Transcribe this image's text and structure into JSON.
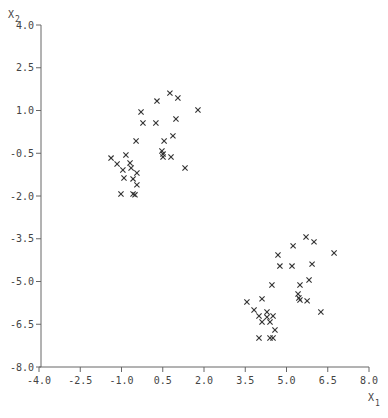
{
  "chart_data": {
    "type": "scatter",
    "title": "",
    "xlabel": "X1",
    "ylabel": "X2",
    "xlabel_main": "X",
    "xlabel_sub": "1",
    "ylabel_main": "X",
    "ylabel_sub": "2",
    "xlim": [
      -4.0,
      8.0
    ],
    "ylim": [
      -8.0,
      4.0
    ],
    "grid": false,
    "legend": null,
    "marker": "x",
    "x_ticks": [
      "-4.0",
      "-2.5",
      "-1.0",
      "0.5",
      "2.0",
      "3.5",
      "5.0",
      "6.5",
      "8.0"
    ],
    "y_ticks": [
      "4.0",
      "2.5",
      "1.0",
      "-0.5",
      "-2.0",
      "-3.5",
      "-5.0",
      "-6.5",
      "-8.0"
    ],
    "series": [
      {
        "name": "cluster-1",
        "points": [
          [
            0.76,
            1.61
          ],
          [
            1.05,
            1.44
          ],
          [
            0.29,
            1.33
          ],
          [
            1.78,
            1.02
          ],
          [
            -0.29,
            0.95
          ],
          [
            -0.22,
            0.56
          ],
          [
            0.25,
            0.56
          ],
          [
            0.98,
            0.7
          ],
          [
            -0.47,
            -0.07
          ],
          [
            0.55,
            -0.07
          ],
          [
            0.87,
            0.11
          ],
          [
            0.47,
            -0.42
          ],
          [
            0.51,
            -0.53
          ],
          [
            0.51,
            -0.63
          ],
          [
            0.8,
            -0.63
          ],
          [
            1.31,
            -1.02
          ],
          [
            -1.38,
            -0.67
          ],
          [
            -0.84,
            -0.56
          ],
          [
            -1.16,
            -0.88
          ],
          [
            -0.69,
            -0.84
          ],
          [
            -0.95,
            -1.09
          ],
          [
            -0.65,
            -1.02
          ],
          [
            -0.44,
            -1.19
          ],
          [
            -0.91,
            -1.37
          ],
          [
            -0.58,
            -1.4
          ],
          [
            -0.44,
            -1.61
          ],
          [
            -1.02,
            -1.93
          ],
          [
            -0.58,
            -1.93
          ],
          [
            -0.51,
            -1.96
          ]
        ]
      },
      {
        "name": "cluster-2",
        "points": [
          [
            5.71,
            -3.44
          ],
          [
            6.0,
            -3.61
          ],
          [
            5.24,
            -3.75
          ],
          [
            6.73,
            -4.0
          ],
          [
            4.69,
            -4.07
          ],
          [
            4.76,
            -4.46
          ],
          [
            5.2,
            -4.46
          ],
          [
            5.93,
            -4.39
          ],
          [
            5.82,
            -4.95
          ],
          [
            5.49,
            -5.12
          ],
          [
            4.47,
            -5.12
          ],
          [
            5.42,
            -5.44
          ],
          [
            5.45,
            -5.58
          ],
          [
            5.49,
            -5.65
          ],
          [
            5.75,
            -5.68
          ],
          [
            6.25,
            -6.07
          ],
          [
            3.56,
            -5.72
          ],
          [
            4.11,
            -5.61
          ],
          [
            3.82,
            -6.0
          ],
          [
            4.0,
            -6.21
          ],
          [
            4.29,
            -6.07
          ],
          [
            4.29,
            -6.25
          ],
          [
            4.51,
            -6.21
          ],
          [
            4.11,
            -6.42
          ],
          [
            4.4,
            -6.42
          ],
          [
            4.58,
            -6.7
          ],
          [
            4.0,
            -6.98
          ],
          [
            4.4,
            -6.98
          ],
          [
            4.51,
            -6.98
          ]
        ]
      }
    ],
    "colors": {
      "axis": "#666666",
      "marker": "#333333",
      "text": "#444444",
      "background": "#ffffff"
    }
  }
}
